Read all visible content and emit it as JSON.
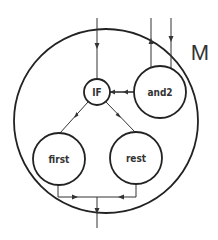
{
  "diagram": {
    "module_label": "M",
    "nodes": [
      {
        "id": "if",
        "label": "IF"
      },
      {
        "id": "and2",
        "label": "and2"
      },
      {
        "id": "first",
        "label": "first"
      },
      {
        "id": "rest",
        "label": "rest"
      }
    ],
    "edges": [
      {
        "from": "external-top",
        "to": "if",
        "direction": "down"
      },
      {
        "from": "and2",
        "to": "external-top",
        "direction": "up"
      },
      {
        "from": "external-top",
        "to": "and2",
        "direction": "down"
      },
      {
        "from": "and2",
        "to": "if",
        "direction": "left"
      },
      {
        "from": "if",
        "to": "first",
        "direction": "down-left"
      },
      {
        "from": "if",
        "to": "rest",
        "direction": "down-right"
      },
      {
        "from": "first",
        "to": "merge",
        "direction": "right"
      },
      {
        "from": "rest",
        "to": "merge",
        "direction": "left"
      },
      {
        "from": "merge",
        "to": "external-bottom",
        "direction": "down"
      }
    ],
    "colors": {
      "stroke": "#222222",
      "background": "#ffffff"
    }
  }
}
